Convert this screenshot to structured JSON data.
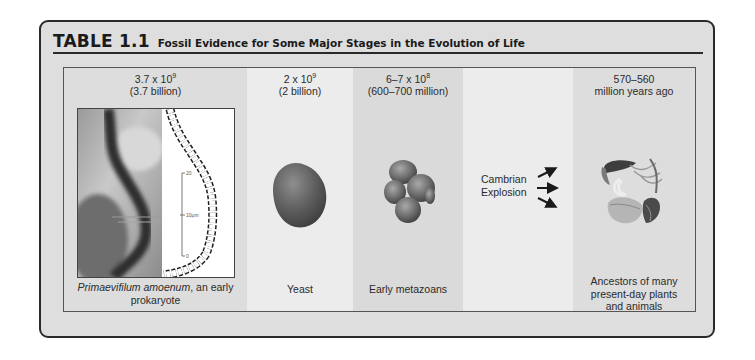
{
  "table": {
    "number": "TABLE 1.1",
    "caption": "Fossil Evidence for Some Major Stages in the Evolution of Life"
  },
  "columns": [
    {
      "date_base": "3.7 x 10",
      "date_exp": "9",
      "date_words": "(3.7 billion)",
      "image": "prokaryote-fossil-photo-and-drawing-icon",
      "scale_bar": {
        "top": "20",
        "mid": "10μm",
        "bottom": "0"
      },
      "caption_italic": "Primaevifilum amoenum",
      "caption_rest": ", an early prokaryote"
    },
    {
      "date_base": "2 x 10",
      "date_exp": "9",
      "date_words": "(2 billion)",
      "image": "yeast-cell-icon",
      "caption": "Yeast"
    },
    {
      "date_base": "6–7 x 10",
      "date_exp": "8",
      "date_words": "(600–700 million)",
      "image": "metazoan-cell-cluster-icon",
      "caption": "Early metazoans"
    },
    {
      "label_line1": "Cambrian",
      "label_line2": "Explosion",
      "image": "diverging-arrows-icon"
    },
    {
      "date_line1": "570–560",
      "date_line2": "million years ago",
      "image": "early-plants-animals-illustration-icon",
      "caption_line1": "Ancestors of many",
      "caption_line2": "present-day plants",
      "caption_line3": "and animals"
    }
  ]
}
